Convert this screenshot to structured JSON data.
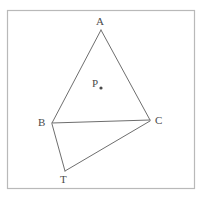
{
  "figure": {
    "canvas": {
      "width": 203,
      "height": 199,
      "background": "#ffffff"
    },
    "border": {
      "name": "figure-border",
      "x": 7,
      "y": 10,
      "width": 187,
      "height": 178,
      "color": "#b9b9b9",
      "stroke_width": 1.2
    },
    "stroke_color": "#6e6e6e",
    "stroke_width": 1,
    "label_color": "#4a4a4a",
    "points": [
      {
        "id": "A",
        "label": "A",
        "x": 101,
        "y": 30,
        "label_x": 96,
        "label_y": 16
      },
      {
        "id": "B",
        "label": "B",
        "x": 52,
        "y": 123,
        "label_x": 38,
        "label_y": 117
      },
      {
        "id": "C",
        "label": "C",
        "x": 150,
        "y": 120,
        "label_x": 155,
        "label_y": 115
      },
      {
        "id": "T",
        "label": "T",
        "x": 65,
        "y": 171,
        "label_x": 60,
        "label_y": 174
      },
      {
        "id": "P",
        "label": "P",
        "x": 101,
        "y": 88,
        "label_x": 92,
        "label_y": 78,
        "dot": true,
        "dot_radius": 1.6
      }
    ],
    "segments": [
      {
        "name": "segment-AB",
        "from": "A",
        "to": "B",
        "x1": 101,
        "y1": 30,
        "x2": 52,
        "y2": 123
      },
      {
        "name": "segment-AC",
        "from": "A",
        "to": "C",
        "x1": 101,
        "y1": 30,
        "x2": 150,
        "y2": 120
      },
      {
        "name": "segment-BC",
        "from": "B",
        "to": "C",
        "x1": 52,
        "y1": 123,
        "x2": 150,
        "y2": 120
      },
      {
        "name": "segment-BT",
        "from": "B",
        "to": "T",
        "x1": 52,
        "y1": 124,
        "x2": 65,
        "y2": 171
      },
      {
        "name": "segment-TC",
        "from": "T",
        "to": "C",
        "x1": 65,
        "y1": 171,
        "x2": 150,
        "y2": 121
      }
    ]
  }
}
